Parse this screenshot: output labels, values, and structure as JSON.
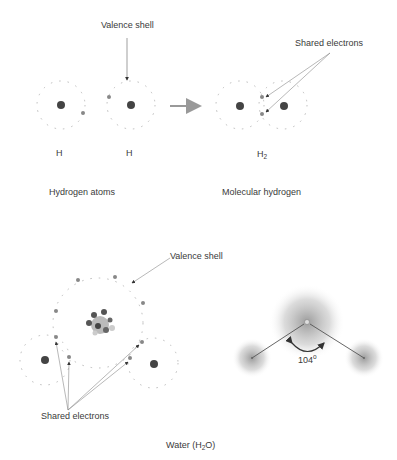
{
  "labels": {
    "valence_shell_top": "Valence shell",
    "shared_electrons_top": "Shared electrons",
    "h_left": "H",
    "h_right": "H",
    "h2_base": "H",
    "h2_sub": "2",
    "hydrogen_atoms": "Hydrogen atoms",
    "molecular_hydrogen": "Molecular hydrogen",
    "valence_shell_bottom": "Valence shell",
    "shared_electrons_bottom": "Shared electrons",
    "angle_value": "104",
    "angle_unit": "o",
    "water_prefix": "Water (H",
    "water_sub": "2",
    "water_suffix": "O)"
  },
  "colors": {
    "nucleus": "#444444",
    "electron": "#888888",
    "shell": "#bbbbbb",
    "arrow": "#999999",
    "cloud": "#9a9a9a"
  }
}
